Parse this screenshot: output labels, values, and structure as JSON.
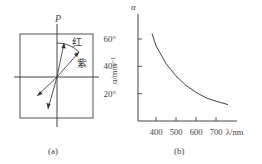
{
  "figure_a": {
    "axis_label": "P",
    "label_red": "红",
    "label_violet": "紫",
    "caption": "(a)"
  },
  "figure_b": {
    "caption": "(b)"
  },
  "chart_data": {
    "type": "line",
    "title": "",
    "xlabel": "λ/nm",
    "ylabel": "α/mm⁻¹",
    "ylabel_top": "α",
    "x_ticks": [
      400,
      500,
      600,
      700
    ],
    "x_tick_labels": [
      "400",
      "500",
      "600",
      "700"
    ],
    "y_ticks": [
      20,
      40,
      60
    ],
    "y_tick_labels": [
      "20°",
      "40°",
      "60°"
    ],
    "xlim": [
      330,
      800
    ],
    "ylim": [
      0,
      75
    ],
    "grid": false,
    "series": [
      {
        "name": "rotation angle vs wavelength",
        "x": [
          380,
          400,
          450,
          500,
          550,
          600,
          650,
          700,
          760
        ],
        "y": [
          64,
          55,
          42,
          33,
          26,
          21,
          17,
          14.5,
          12
        ]
      }
    ]
  }
}
